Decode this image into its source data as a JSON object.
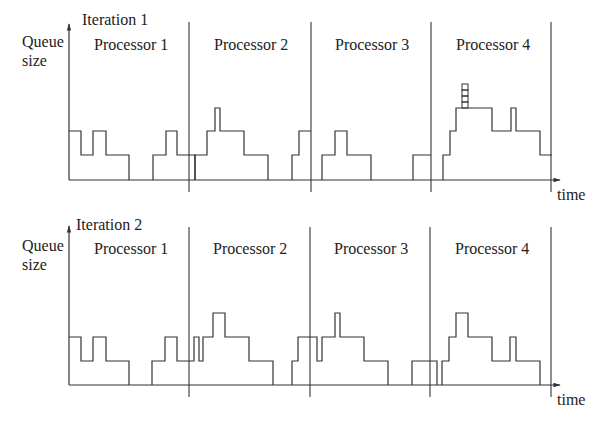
{
  "diagram": {
    "stroke_color": "#333333",
    "y_axis_label": [
      "Queue",
      "size"
    ],
    "x_axis_label": "time",
    "panels": [
      {
        "title": "Iteration 1",
        "processors": [
          "Processor 1",
          "Processor 2",
          "Processor 3",
          "Processor 4"
        ],
        "axis": {
          "x0": 69,
          "y_top": 24,
          "baseline": 180,
          "x_end": 560
        },
        "dividers": [
          189,
          311,
          431,
          551
        ],
        "divider_range": [
          22,
          192
        ],
        "traces": [
          [
            [
              69,
              131
            ],
            [
              81,
              131
            ],
            [
              81,
              155
            ],
            [
              93,
              155
            ],
            [
              93,
              131
            ],
            [
              106,
              131
            ],
            [
              106,
              155
            ],
            [
              129,
              155
            ],
            [
              129,
              180
            ]
          ],
          [
            [
              153,
              180
            ],
            [
              153,
              155
            ],
            [
              166,
              155
            ],
            [
              166,
              131
            ],
            [
              177,
              131
            ],
            [
              177,
              155
            ],
            [
              189,
              155
            ]
          ],
          [
            [
              189,
              155
            ],
            [
              195,
              155
            ],
            [
              195,
              180
            ]
          ],
          [
            [
              195,
              180
            ],
            [
              195,
              155
            ],
            [
              207,
              155
            ],
            [
              207,
              131
            ],
            [
              215,
              131
            ],
            [
              215,
              108
            ],
            [
              220,
              108
            ],
            [
              220,
              131
            ],
            [
              244,
              131
            ],
            [
              244,
              155
            ],
            [
              268,
              155
            ],
            [
              268,
              180
            ]
          ],
          [
            [
              292,
              180
            ],
            [
              292,
              155
            ],
            [
              299,
              155
            ],
            [
              299,
              131
            ],
            [
              311,
              131
            ]
          ],
          [
            [
              322,
              180
            ],
            [
              322,
              155
            ],
            [
              335,
              155
            ],
            [
              335,
              131
            ],
            [
              347,
              131
            ],
            [
              347,
              155
            ],
            [
              371,
              155
            ],
            [
              371,
              180
            ]
          ],
          [
            [
              413,
              180
            ],
            [
              413,
              155
            ],
            [
              431,
              155
            ]
          ],
          [
            [
              443,
              180
            ],
            [
              443,
              155
            ],
            [
              450,
              155
            ],
            [
              450,
              131
            ],
            [
              456,
              131
            ],
            [
              456,
              108
            ],
            [
              492,
              108
            ],
            [
              492,
              131
            ],
            [
              511,
              131
            ],
            [
              511,
              108
            ],
            [
              516,
              108
            ],
            [
              516,
              131
            ],
            [
              540,
              131
            ],
            [
              540,
              155
            ],
            [
              552,
              155
            ]
          ]
        ],
        "stack": {
          "x": 462,
          "width": 6,
          "y_bottom": 108,
          "boxes": 4,
          "box_height": 6
        }
      },
      {
        "title": "Iteration 2",
        "processors": [
          "Processor 1",
          "Processor 2",
          "Processor 3",
          "Processor 4"
        ],
        "axis": {
          "x0": 69,
          "y_top": 226,
          "baseline": 385,
          "x_end": 560
        },
        "dividers": [
          189,
          310,
          430,
          551
        ],
        "divider_range": [
          227,
          397
        ],
        "traces": [
          [
            [
              69,
              337
            ],
            [
              81,
              337
            ],
            [
              81,
              361
            ],
            [
              93,
              361
            ],
            [
              93,
              337
            ],
            [
              106,
              337
            ],
            [
              106,
              361
            ],
            [
              129,
              361
            ],
            [
              129,
              385
            ]
          ],
          [
            [
              152,
              385
            ],
            [
              152,
              361
            ],
            [
              165,
              361
            ],
            [
              165,
              337
            ],
            [
              177,
              337
            ],
            [
              177,
              361
            ],
            [
              194,
              361
            ],
            [
              194,
              337
            ],
            [
              199,
              337
            ],
            [
              199,
              361
            ],
            [
              203,
              361
            ],
            [
              203,
              337
            ],
            [
              213,
              337
            ],
            [
              213,
              313
            ],
            [
              225,
              313
            ],
            [
              225,
              337
            ],
            [
              249,
              337
            ],
            [
              249,
              361
            ],
            [
              273,
              361
            ],
            [
              273,
              385
            ]
          ],
          [
            [
              292,
              385
            ],
            [
              292,
              361
            ],
            [
              298,
              361
            ],
            [
              298,
              337
            ],
            [
              317,
              337
            ],
            [
              317,
              361
            ],
            [
              322,
              361
            ],
            [
              322,
              337
            ],
            [
              335,
              337
            ],
            [
              335,
              313
            ],
            [
              340,
              313
            ],
            [
              340,
              337
            ],
            [
              364,
              337
            ],
            [
              364,
              361
            ],
            [
              388,
              361
            ],
            [
              388,
              385
            ]
          ],
          [
            [
              412,
              385
            ],
            [
              412,
              361
            ],
            [
              437,
              361
            ],
            [
              437,
              385
            ]
          ],
          [
            [
              442,
              385
            ],
            [
              442,
              361
            ],
            [
              449,
              361
            ],
            [
              449,
              337
            ],
            [
              456,
              337
            ],
            [
              456,
              313
            ],
            [
              468,
              313
            ],
            [
              468,
              337
            ],
            [
              492,
              337
            ],
            [
              492,
              361
            ],
            [
              510,
              361
            ],
            [
              510,
              337
            ],
            [
              516,
              337
            ],
            [
              516,
              361
            ],
            [
              540,
              361
            ],
            [
              540,
              385
            ]
          ]
        ],
        "stack": null
      }
    ]
  }
}
